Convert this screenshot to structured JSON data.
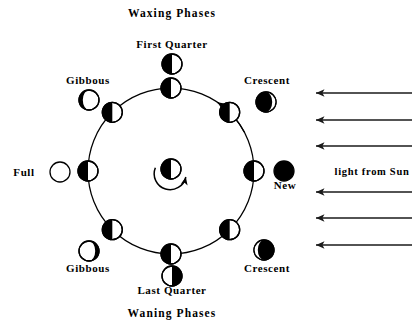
{
  "diagram": {
    "headings": {
      "top": "Waxing Phases",
      "bottom": "Waning Phases"
    },
    "sun_label": "light from Sun",
    "colors": {
      "lit": "#ffffff",
      "dark": "#000000",
      "stroke": "#000000",
      "background": "#ffffff",
      "ray": "#1a1a1a"
    },
    "orbit": {
      "center_x": 171,
      "center_y": 171,
      "radius": 83
    },
    "earth": {
      "name": "Earth",
      "cx": 171,
      "cy": 169,
      "r": 10,
      "lit_side": "right"
    },
    "rotation_arrow": {
      "name": "earth-rotation-arrow",
      "direction": "counterclockwise"
    },
    "orbit_moons": [
      {
        "name": "orbit-moon-new",
        "angle_deg": 0,
        "r": 10
      },
      {
        "name": "orbit-moon-waxing-crescent",
        "angle_deg": 45,
        "r": 10
      },
      {
        "name": "orbit-moon-first-quarter",
        "angle_deg": 90,
        "r": 10
      },
      {
        "name": "orbit-moon-waxing-gibbous",
        "angle_deg": 135,
        "r": 10
      },
      {
        "name": "orbit-moon-full",
        "angle_deg": 180,
        "r": 10
      },
      {
        "name": "orbit-moon-waning-gibbous",
        "angle_deg": 225,
        "r": 10
      },
      {
        "name": "orbit-moon-last-quarter",
        "angle_deg": 270,
        "r": 10
      },
      {
        "name": "orbit-moon-waning-crescent",
        "angle_deg": 315,
        "r": 10
      }
    ],
    "phase_labels": [
      {
        "name": "phase-first-quarter",
        "text": "First Quarter",
        "text_x": 172,
        "text_y": 48,
        "anchor": "middle",
        "icon_cx": 172,
        "icon_cy": 64,
        "icon_r": 10,
        "phase": "first-quarter"
      },
      {
        "name": "phase-gibbous-waxing",
        "text": "Gibbous",
        "text_x": 88,
        "text_y": 84,
        "anchor": "middle",
        "icon_cx": 89,
        "icon_cy": 100,
        "icon_r": 10,
        "phase": "waxing-gibbous"
      },
      {
        "name": "phase-crescent-waxing",
        "text": "Crescent",
        "text_x": 267,
        "text_y": 84,
        "anchor": "middle",
        "icon_cx": 266,
        "icon_cy": 102,
        "icon_r": 10,
        "phase": "waxing-crescent"
      },
      {
        "name": "phase-full",
        "text": "Full",
        "text_x": 24,
        "text_y": 176,
        "anchor": "middle",
        "icon_cx": 60,
        "icon_cy": 172,
        "icon_r": 10,
        "phase": "full"
      },
      {
        "name": "phase-new",
        "text": "New",
        "text_x": 285,
        "text_y": 189,
        "anchor": "middle",
        "icon_cx": 284,
        "icon_cy": 171,
        "icon_r": 10,
        "phase": "new"
      },
      {
        "name": "phase-gibbous-waning",
        "text": "Gibbous",
        "text_x": 88,
        "text_y": 272,
        "anchor": "middle",
        "icon_cx": 89,
        "icon_cy": 251,
        "icon_r": 10,
        "phase": "waning-gibbous"
      },
      {
        "name": "phase-crescent-waning",
        "text": "Crescent",
        "text_x": 267,
        "text_y": 272,
        "anchor": "middle",
        "icon_cx": 264,
        "icon_cy": 250,
        "icon_r": 10,
        "phase": "waning-crescent"
      },
      {
        "name": "phase-last-quarter",
        "text": "Last Quarter",
        "text_x": 172,
        "text_y": 294,
        "anchor": "middle",
        "icon_cx": 172,
        "icon_cy": 276,
        "icon_r": 10,
        "phase": "last-quarter"
      }
    ],
    "heading_positions": {
      "top": {
        "x": 172,
        "y": 17
      },
      "bottom": {
        "x": 172,
        "y": 317
      }
    },
    "sun_label_position": {
      "x": 372,
      "y": 175
    },
    "sun_rays": [
      {
        "name": "sun-ray-1",
        "y": 93,
        "x_tip": 316,
        "x_tail": 412
      },
      {
        "name": "sun-ray-2",
        "y": 120,
        "x_tip": 316,
        "x_tail": 412
      },
      {
        "name": "sun-ray-3",
        "y": 146,
        "x_tip": 316,
        "x_tail": 412
      },
      {
        "name": "sun-ray-4",
        "y": 192,
        "x_tip": 316,
        "x_tail": 412
      },
      {
        "name": "sun-ray-5",
        "y": 218,
        "x_tip": 316,
        "x_tail": 412
      },
      {
        "name": "sun-ray-6",
        "y": 245,
        "x_tip": 316,
        "x_tail": 412
      }
    ],
    "orbit_direction_arrow": {
      "name": "orbit-direction-arrow",
      "note": "counterclockwise along orbit, upper right"
    }
  },
  "chart_data": {
    "type": "diagram",
    "annotations": [
      "Waxing Phases",
      "Waning Phases",
      "light from Sun"
    ],
    "points": [
      {
        "position_angle_deg": 0,
        "phase_name": "New",
        "illuminated_fraction": 0.0,
        "label": "New"
      },
      {
        "position_angle_deg": 45,
        "phase_name": "Crescent",
        "illuminated_fraction": 0.15,
        "label": "Crescent"
      },
      {
        "position_angle_deg": 90,
        "phase_name": "First Quarter",
        "illuminated_fraction": 0.5,
        "label": "First Quarter"
      },
      {
        "position_angle_deg": 135,
        "phase_name": "Gibbous",
        "illuminated_fraction": 0.85,
        "label": "Gibbous"
      },
      {
        "position_angle_deg": 180,
        "phase_name": "Full",
        "illuminated_fraction": 1.0,
        "label": "Full"
      },
      {
        "position_angle_deg": 225,
        "phase_name": "Gibbous",
        "illuminated_fraction": 0.85,
        "label": "Gibbous"
      },
      {
        "position_angle_deg": 270,
        "phase_name": "Last Quarter",
        "illuminated_fraction": 0.5,
        "label": "Last Quarter"
      },
      {
        "position_angle_deg": 315,
        "phase_name": "Crescent",
        "illuminated_fraction": 0.15,
        "label": "Crescent"
      }
    ]
  }
}
